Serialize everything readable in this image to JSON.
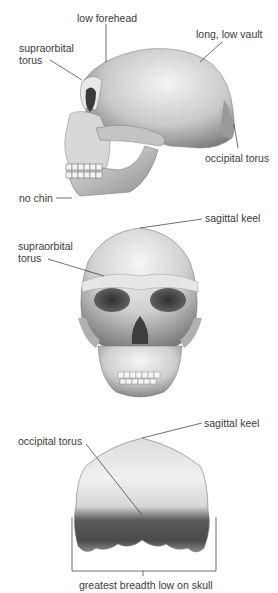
{
  "diagram": {
    "views": [
      {
        "id": "lateral",
        "labels": {
          "low_forehead": "low forehead",
          "long_low_vault": "long, low vault",
          "supraorbital_torus_1": "supraorbital",
          "supraorbital_torus_2": "torus",
          "occipital_torus": "occipital torus",
          "no_chin": "no chin"
        }
      },
      {
        "id": "frontal",
        "labels": {
          "sagittal_keel": "sagittal keel",
          "supraorbital_torus_1": "supraorbital",
          "supraorbital_torus_2": "torus"
        }
      },
      {
        "id": "posterior",
        "labels": {
          "sagittal_keel": "sagittal keel",
          "occipital_torus": "occipital torus",
          "greatest_breadth": "greatest breadth low on skull"
        }
      }
    ],
    "colors": {
      "background": "#ffffff",
      "bone_light": "#f2f2f2",
      "bone_mid": "#b8b8b8",
      "bone_dark": "#5a5a5a",
      "leader_line": "#333333"
    }
  }
}
